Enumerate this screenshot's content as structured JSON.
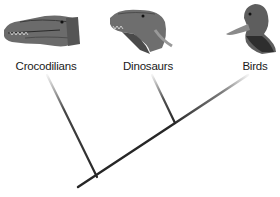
{
  "diagram": {
    "type": "cladogram",
    "taxa": [
      {
        "label": "Crocodilians",
        "icon": "crocodile-head-icon",
        "x": 46
      },
      {
        "label": "Dinosaurs",
        "icon": "dinosaur-head-icon",
        "x": 148
      },
      {
        "label": "Birds",
        "icon": "duck-head-icon",
        "x": 255
      }
    ],
    "colors": {
      "line": "#262626",
      "text": "#1a1a1a",
      "background": "#ffffff"
    }
  }
}
